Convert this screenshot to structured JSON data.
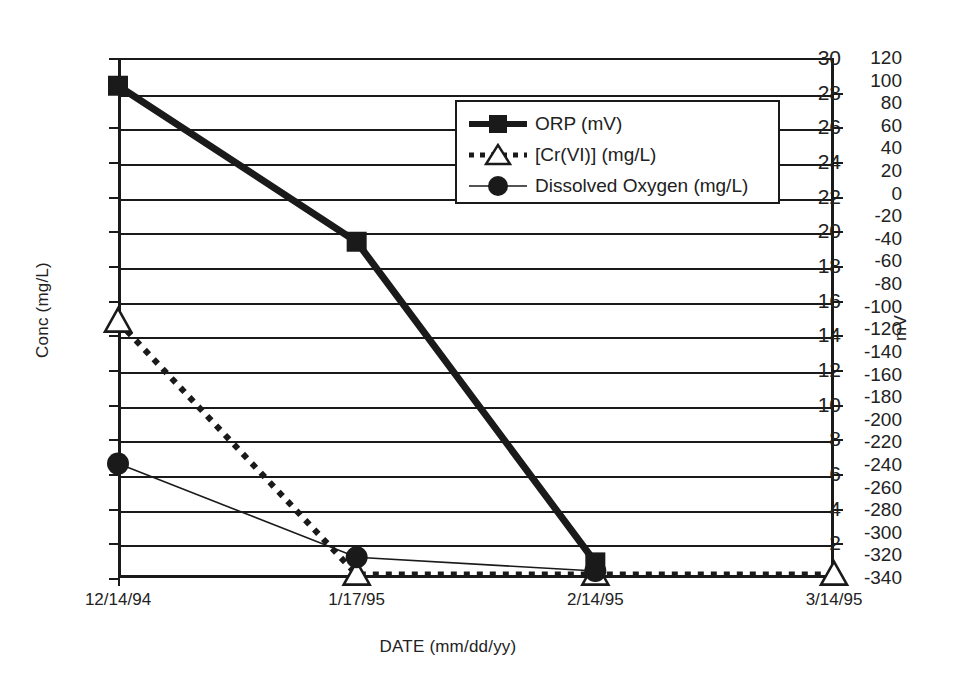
{
  "chart_data": {
    "type": "line",
    "title": "",
    "xlabel": "DATE (mm/dd/yy)",
    "ylabel": "Conc (mg/L)",
    "y2label": "mV",
    "categories": [
      "12/14/94",
      "1/17/95",
      "2/14/95",
      "3/14/95"
    ],
    "ylim": [
      0,
      30
    ],
    "y2lim": [
      -340,
      120
    ],
    "yticks": [
      0,
      2,
      4,
      6,
      8,
      10,
      12,
      14,
      16,
      18,
      20,
      22,
      24,
      26,
      28,
      30
    ],
    "y2ticks": [
      120,
      100,
      80,
      60,
      40,
      20,
      0,
      -20,
      -40,
      -60,
      -80,
      -100,
      -120,
      -140,
      -160,
      -180,
      -200,
      -220,
      -240,
      -260,
      -280,
      -300,
      -320,
      -340
    ],
    "grid": "horizontal",
    "legend_position": "upper-center",
    "series": [
      {
        "name": "ORP (mV)",
        "axis": "right",
        "units": "mV",
        "marker": "filled-square",
        "line": "thick-solid",
        "x": [
          "12/14/94",
          "1/17/95",
          "2/14/95"
        ],
        "values": [
          96,
          -42,
          -326
        ],
        "values_left_axis_equivalent": [
          28.4,
          19.4,
          0.9
        ]
      },
      {
        "name": "[Cr(VI)] (mg/L)",
        "axis": "left",
        "units": "mg/L",
        "marker": "open-triangle",
        "line": "dotted",
        "x": [
          "12/14/94",
          "1/17/95",
          "2/14/95",
          "3/14/95"
        ],
        "values": [
          14.8,
          0.2,
          0.2,
          0.2
        ]
      },
      {
        "name": "Dissolved Oxygen (mg/L)",
        "axis": "left",
        "units": "mg/L",
        "marker": "filled-circle",
        "line": "thin-solid",
        "x": [
          "12/14/94",
          "1/17/95",
          "2/14/95"
        ],
        "values": [
          6.6,
          1.2,
          0.4
        ]
      }
    ]
  },
  "axes": {
    "left_title": "Conc (mg/L)",
    "right_title": "mV",
    "x_title": "DATE (mm/dd/yy)"
  },
  "legend": {
    "entries": [
      {
        "label": "ORP (mV)",
        "marker": "filled-square-icon"
      },
      {
        "label": "[Cr(VI)] (mg/L)",
        "marker": "open-triangle-icon"
      },
      {
        "label": "Dissolved Oxygen (mg/L)",
        "marker": "filled-circle-icon"
      }
    ]
  },
  "colors": {
    "ink": "#1a1a1a",
    "background": "#ffffff"
  }
}
